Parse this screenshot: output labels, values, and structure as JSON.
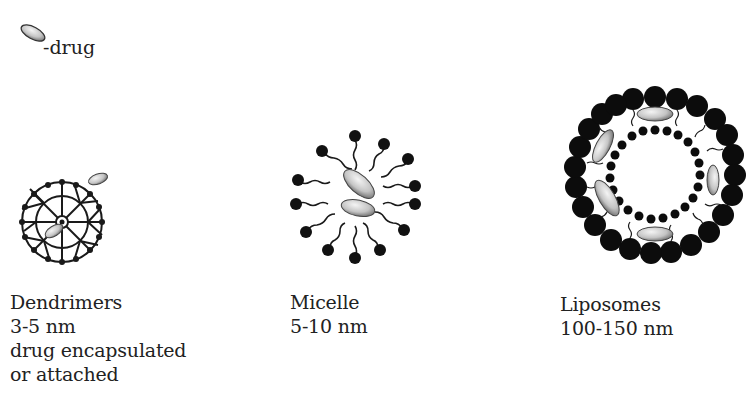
{
  "legend": {
    "icon": "drug-ellipse-icon",
    "label": "-drug"
  },
  "carriers": [
    {
      "name": "Dendrimers",
      "size": "3-5 nm",
      "notes": [
        "drug encapsulated",
        "or attached"
      ]
    },
    {
      "name": "Micelle",
      "size": "5-10 nm",
      "notes": []
    },
    {
      "name": "Liposomes",
      "size": "100-150 nm",
      "notes": []
    }
  ],
  "colors": {
    "background": "#ffffff",
    "ink": "#111111",
    "drug_light": "#e6e6e6",
    "drug_dark": "#777777"
  }
}
